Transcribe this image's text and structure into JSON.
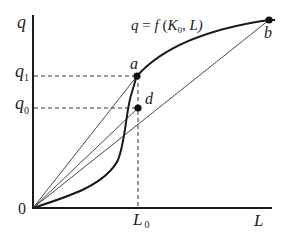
{
  "diagram": {
    "colors": {
      "curve": "#1a1a1a",
      "rays": "#333333",
      "dashes": "#333333",
      "axes": "#1a1a1a",
      "points": "#111111"
    },
    "axes": {
      "y_label": "q",
      "x_label": "L",
      "origin_label": "0"
    },
    "function_label": {
      "q": "q",
      "eq": " = ",
      "f": "f",
      "open": " (",
      "K": "K",
      "K_sub": "0",
      "rest": ", L)"
    },
    "y_ticks": [
      {
        "main": "q",
        "sub": "1"
      },
      {
        "main": "q",
        "sub": "0"
      }
    ],
    "x_ticks": [
      {
        "main": "L",
        "sub": "0"
      }
    ],
    "points": [
      {
        "id": "a",
        "label": "a"
      },
      {
        "id": "d",
        "label": "d"
      },
      {
        "id": "b",
        "label": "b"
      }
    ]
  }
}
